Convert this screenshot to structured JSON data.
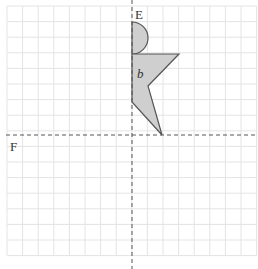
{
  "diagram": {
    "type": "reflection-grid",
    "grid": {
      "x0": 7,
      "y0": 6,
      "cell": 15.6,
      "cols": 16,
      "rows": 16,
      "color": "#e4e4e4"
    },
    "axes": {
      "vertical": {
        "label": "E",
        "x": 132,
        "color": "#555555"
      },
      "horizontal": {
        "label": "F",
        "y": 135,
        "color": "#555555"
      }
    },
    "shape": {
      "label": "b",
      "fill": "#cfcfcf",
      "stroke": "#555555",
      "semicircle": {
        "cx": 132,
        "cy": 38,
        "r": 16
      },
      "polygon": [
        [
          132,
          54
        ],
        [
          179,
          54
        ],
        [
          148,
          86
        ],
        [
          162,
          135
        ],
        [
          132,
          102
        ]
      ]
    }
  }
}
